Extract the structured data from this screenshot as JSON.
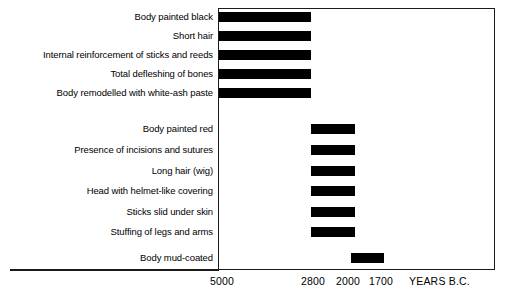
{
  "chart_data": {
    "type": "bar",
    "orientation": "horizontal",
    "title": "",
    "subtitle": "",
    "xlabel": "YEARS B.C.",
    "ylabel": "",
    "grid": false,
    "legend": null,
    "axis": {
      "note": "x axis runs right-to-left in time: older (5000 B.C.) at left, younger (1700 B.C.) at right",
      "tick_labels": [
        "5000",
        "2800",
        "2000",
        "1700"
      ],
      "tick_values": [
        5000,
        2800,
        2000,
        1700
      ],
      "tick_x_px": [
        222,
        313,
        348,
        381
      ],
      "caption": "YEARS B.C.",
      "xlim_labels": [
        "5000",
        "1700"
      ]
    },
    "categories": [
      "Body painted black",
      "Short hair",
      "Internal reinforcement of sticks and reeds",
      "Total defleshing of bones",
      "Body remodelled with white-ash paste",
      "Body painted red",
      "Presence of incisions and sutures",
      "Long hair (wig)",
      "Head with helmet-like covering",
      "Sticks slid under skin",
      "Stuffing of legs and arms",
      "Body mud-coated"
    ],
    "groups": [
      {
        "name": "Black mummies",
        "start_label": "5000",
        "end_label": "2800",
        "start": 5000,
        "end": 2800,
        "categories": [
          "Body painted black",
          "Short hair",
          "Internal reinforcement of sticks and reeds",
          "Total defleshing of bones",
          "Body remodelled with white-ash paste"
        ]
      },
      {
        "name": "Red mummies",
        "start_label": "2800",
        "end_label": "2000",
        "start": 2800,
        "end": 2000,
        "categories": [
          "Body painted red",
          "Presence of incisions and sutures",
          "Long hair (wig)",
          "Head with helmet-like covering",
          "Sticks slid under skin",
          "Stuffing of legs and arms"
        ]
      },
      {
        "name": "Mud-coated mummies",
        "start_label": "2000",
        "end_label": "1700",
        "start": 2000,
        "end": 1700,
        "categories": [
          "Body mud-coated"
        ]
      }
    ],
    "bars": [
      {
        "category": "Body painted black",
        "start": 5000,
        "end": 2800,
        "start_label": "5000",
        "end_label": "2800",
        "x_px": 219,
        "w_px": 92,
        "y_px": 12
      },
      {
        "category": "Short hair",
        "start": 5000,
        "end": 2800,
        "start_label": "5000",
        "end_label": "2800",
        "x_px": 219,
        "w_px": 92,
        "y_px": 31
      },
      {
        "category": "Internal reinforcement of sticks and reeds",
        "start": 5000,
        "end": 2800,
        "start_label": "5000",
        "end_label": "2800",
        "x_px": 219,
        "w_px": 92,
        "y_px": 50
      },
      {
        "category": "Total defleshing of bones",
        "start": 5000,
        "end": 2800,
        "start_label": "5000",
        "end_label": "2800",
        "x_px": 219,
        "w_px": 92,
        "y_px": 69
      },
      {
        "category": "Body remodelled with white-ash paste",
        "start": 5000,
        "end": 2800,
        "start_label": "5000",
        "end_label": "2800",
        "x_px": 219,
        "w_px": 92,
        "y_px": 88
      },
      {
        "category": "Body painted red",
        "start": 2800,
        "end": 2000,
        "start_label": "2800",
        "end_label": "2000",
        "x_px": 311,
        "w_px": 44,
        "y_px": 124
      },
      {
        "category": "Presence of incisions and sutures",
        "start": 2800,
        "end": 2000,
        "start_label": "2800",
        "end_label": "2000",
        "x_px": 311,
        "w_px": 44,
        "y_px": 145
      },
      {
        "category": "Long hair (wig)",
        "start": 2800,
        "end": 2000,
        "start_label": "2800",
        "end_label": "2000",
        "x_px": 311,
        "w_px": 44,
        "y_px": 166
      },
      {
        "category": "Head with helmet-like covering",
        "start": 2800,
        "end": 2000,
        "start_label": "2800",
        "end_label": "2000",
        "x_px": 311,
        "w_px": 44,
        "y_px": 186
      },
      {
        "category": "Sticks slid under skin",
        "start": 2800,
        "end": 2000,
        "start_label": "2800",
        "end_label": "2000",
        "x_px": 311,
        "w_px": 44,
        "y_px": 207
      },
      {
        "category": "Stuffing of legs and arms",
        "start": 2800,
        "end": 2000,
        "start_label": "2800",
        "end_label": "2000",
        "x_px": 311,
        "w_px": 44,
        "y_px": 227
      },
      {
        "category": "Body mud-coated",
        "start": 2000,
        "end": 1700,
        "start_label": "2000",
        "end_label": "1700",
        "x_px": 351,
        "w_px": 33,
        "y_px": 253
      }
    ]
  },
  "labels": {
    "rows": [
      {
        "text": "Body painted black",
        "y_px": 11
      },
      {
        "text": "Short hair",
        "y_px": 30
      },
      {
        "text": "Internal reinforcement of sticks and reeds",
        "y_px": 49
      },
      {
        "text": "Total defleshing of bones",
        "y_px": 68
      },
      {
        "text": "Body remodelled with white-ash paste",
        "y_px": 87
      },
      {
        "text": "Body painted red",
        "y_px": 123
      },
      {
        "text": "Presence of incisions and sutures",
        "y_px": 144
      },
      {
        "text": "Long hair (wig)",
        "y_px": 165
      },
      {
        "text": "Head with helmet-like covering",
        "y_px": 185
      },
      {
        "text": "Sticks slid under skin",
        "y_px": 206
      },
      {
        "text": "Stuffing of legs and arms",
        "y_px": 226
      },
      {
        "text": "Body mud-coated",
        "y_px": 252
      }
    ]
  },
  "axis_labels": {
    "ticks": [
      {
        "text": "5000",
        "cx_px": 222
      },
      {
        "text": "2800",
        "cx_px": 313
      },
      {
        "text": "2000",
        "cx_px": 348
      },
      {
        "text": "1700",
        "cx_px": 381
      }
    ],
    "caption": {
      "text": "YEARS B.C.",
      "x_px": 409
    }
  },
  "colors": {
    "bar": "#000000",
    "frame": "#1a1a1a",
    "background": "#ffffff",
    "text": "#000000"
  }
}
